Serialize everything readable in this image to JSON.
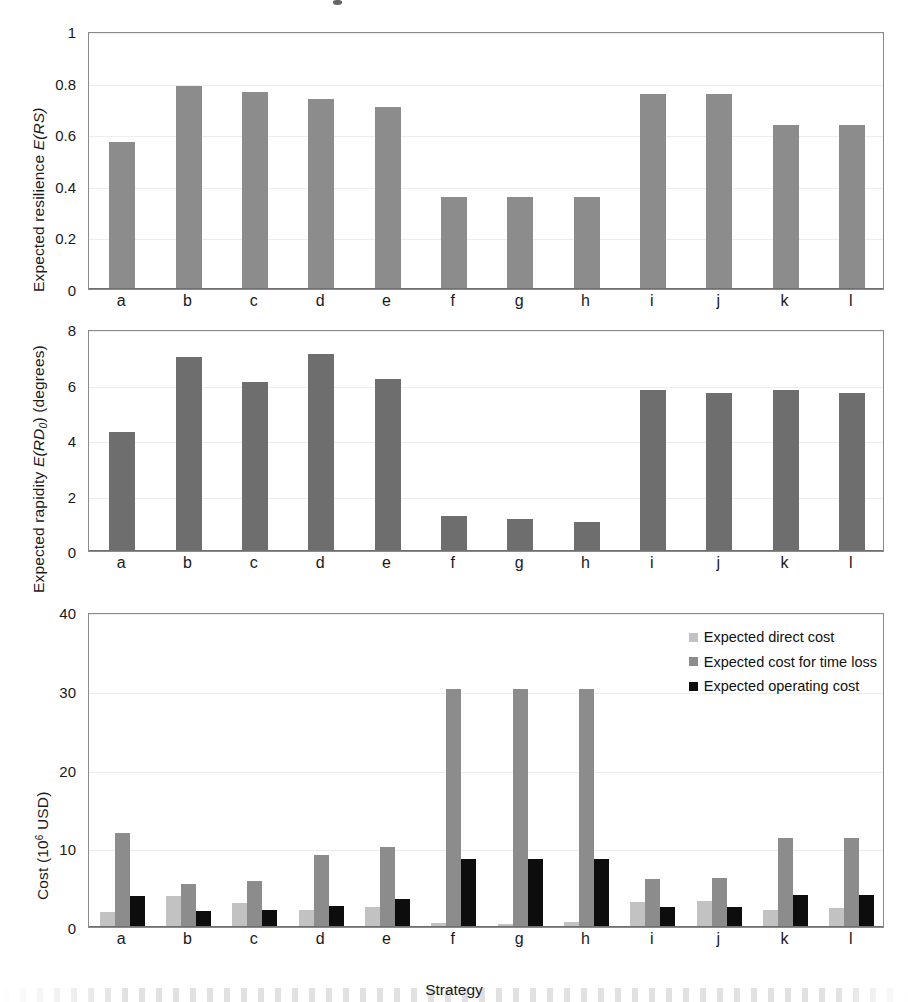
{
  "figure": {
    "xlabel": "Strategy",
    "categories": [
      "a",
      "b",
      "c",
      "d",
      "e",
      "f",
      "g",
      "h",
      "i",
      "j",
      "k",
      "l"
    ]
  },
  "colors": {
    "resilience_bar": "#8c8c8c",
    "rapidity_bar": "#6e6e6e",
    "direct_cost": "#c2c2c2",
    "time_loss_cost": "#8c8c8c",
    "operating_cost": "#0d0d0d",
    "axis": "#8a8a8a",
    "grid": "#ededed",
    "text": "#1a1a1a"
  },
  "panels": {
    "resilience": {
      "ylabel_prefix": "Expected resilience ",
      "ylabel_symbol": "E(RS)",
      "yticks": [
        "0",
        "0.2",
        "0.4",
        "0.6",
        "0.8",
        "1"
      ]
    },
    "rapidity": {
      "ylabel_prefix": "Expected rapidity ",
      "ylabel_symbol": "E(RD",
      "ylabel_sub": "0",
      "ylabel_suffix": ") (degrees)",
      "yticks": [
        "0",
        "2",
        "4",
        "6",
        "8"
      ]
    },
    "cost": {
      "ylabel_prefix": "Cost (10",
      "ylabel_sup": "6",
      "ylabel_suffix": " USD)",
      "yticks": [
        "0",
        "10",
        "20",
        "30",
        "40"
      ],
      "legend": [
        {
          "label": "Expected direct cost",
          "color": "#c2c2c2",
          "swatch": "legend-swatch-direct-cost"
        },
        {
          "label": "Expected cost for time loss",
          "color": "#8c8c8c",
          "swatch": "legend-swatch-time-loss"
        },
        {
          "label": "Expected operating cost",
          "color": "#0d0d0d",
          "swatch": "legend-swatch-operating-cost"
        }
      ]
    }
  },
  "chart_data": [
    {
      "type": "bar",
      "title": "Expected resilience by strategy",
      "xlabel": "Strategy",
      "ylabel": "Expected resilience E(RS)",
      "categories": [
        "a",
        "b",
        "c",
        "d",
        "e",
        "f",
        "g",
        "h",
        "i",
        "j",
        "k",
        "l"
      ],
      "values": [
        0.57,
        0.785,
        0.765,
        0.735,
        0.705,
        0.355,
        0.355,
        0.358,
        0.757,
        0.757,
        0.635,
        0.635
      ],
      "ylim": [
        0,
        1
      ],
      "yticks": [
        0,
        0.2,
        0.4,
        0.6,
        0.8,
        1
      ],
      "grid": true,
      "legend": "none",
      "series": [
        {
          "name": "Expected resilience E(RS)",
          "color": "#8c8c8c",
          "values": [
            0.57,
            0.785,
            0.765,
            0.735,
            0.705,
            0.355,
            0.355,
            0.358,
            0.757,
            0.757,
            0.635,
            0.635
          ]
        }
      ]
    },
    {
      "type": "bar",
      "title": "Expected rapidity by strategy",
      "xlabel": "Strategy",
      "ylabel": "Expected rapidity E(RD0) (degrees)",
      "categories": [
        "a",
        "b",
        "c",
        "d",
        "e",
        "f",
        "g",
        "h",
        "i",
        "j",
        "k",
        "l"
      ],
      "values": [
        4.3,
        7.0,
        6.1,
        7.1,
        6.2,
        1.25,
        1.15,
        1.05,
        5.8,
        5.7,
        5.8,
        5.7
      ],
      "ylim": [
        0,
        8
      ],
      "yticks": [
        0,
        2,
        4,
        6,
        8
      ],
      "grid": true,
      "legend": "none",
      "series": [
        {
          "name": "Expected rapidity E(RD0) (degrees)",
          "color": "#6e6e6e",
          "values": [
            4.3,
            7.0,
            6.1,
            7.1,
            6.2,
            1.25,
            1.15,
            1.05,
            5.8,
            5.7,
            5.8,
            5.7
          ]
        }
      ]
    },
    {
      "type": "bar",
      "title": "Cost by strategy",
      "xlabel": "Strategy",
      "ylabel": "Cost (10^6 USD)",
      "categories": [
        "a",
        "b",
        "c",
        "d",
        "e",
        "f",
        "g",
        "h",
        "i",
        "j",
        "k",
        "l"
      ],
      "ylim": [
        0,
        40
      ],
      "yticks": [
        0,
        10,
        20,
        30,
        40
      ],
      "grid": true,
      "legend": "upper right",
      "series": [
        {
          "name": "Expected direct cost",
          "color": "#c2c2c2",
          "values": [
            1.9,
            4.0,
            3.1,
            2.2,
            2.5,
            0.5,
            0.4,
            0.6,
            3.2,
            3.3,
            2.2,
            2.4
          ]
        },
        {
          "name": "Expected cost for time loss",
          "color": "#8c8c8c",
          "values": [
            12.0,
            5.4,
            5.9,
            9.1,
            10.1,
            30.2,
            30.2,
            30.2,
            6.1,
            6.2,
            11.3,
            11.3
          ]
        },
        {
          "name": "Expected operating cost",
          "color": "#0d0d0d",
          "values": [
            4.0,
            2.0,
            2.2,
            2.7,
            3.5,
            8.6,
            8.6,
            8.6,
            2.5,
            2.5,
            4.1,
            4.1
          ]
        }
      ]
    }
  ]
}
